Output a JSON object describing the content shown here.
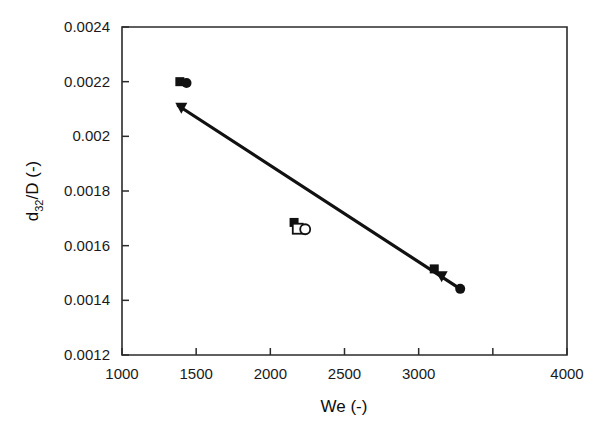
{
  "chart_data": {
    "type": "scatter",
    "title": "",
    "xlabel": "We (-)",
    "ylabel": "d32/D (-)",
    "ylabel_base": "d",
    "ylabel_sub": "32",
    "ylabel_rest": "/D (-)",
    "xlim": [
      1000,
      4000
    ],
    "ylim": [
      0.0012,
      0.0024
    ],
    "grid": false,
    "legend": "none",
    "xticks": [
      1000,
      1500,
      2000,
      2500,
      3000,
      3500,
      4000
    ],
    "xtick_labels": [
      "1000",
      "1500",
      "2000",
      "2500",
      "3000",
      "",
      "4000"
    ],
    "yticks": [
      0.0012,
      0.0014,
      0.0016,
      0.0018,
      0.002,
      0.0022,
      0.0024
    ],
    "ytick_labels": [
      "0.0012",
      "0.0014",
      "0.0016",
      "0.0018",
      "0.002",
      "0.0022",
      "0.0024"
    ],
    "series": [
      {
        "name": "filled-square",
        "marker": "filled-square",
        "points": [
          {
            "x": 1390,
            "y": 0.0022
          },
          {
            "x": 2160,
            "y": 0.001685
          },
          {
            "x": 3105,
            "y": 0.001515
          }
        ]
      },
      {
        "name": "filled-circle",
        "marker": "filled-circle",
        "points": [
          {
            "x": 1435,
            "y": 0.002195
          },
          {
            "x": 3280,
            "y": 0.001442
          }
        ]
      },
      {
        "name": "filled-triangle-down",
        "marker": "filled-triangle-down",
        "points": [
          {
            "x": 1400,
            "y": 0.002105
          },
          {
            "x": 3155,
            "y": 0.001488
          }
        ]
      },
      {
        "name": "open-square",
        "marker": "open-square",
        "points": [
          {
            "x": 2185,
            "y": 0.001662
          }
        ]
      },
      {
        "name": "open-circle",
        "marker": "open-circle",
        "points": [
          {
            "x": 2235,
            "y": 0.00166
          }
        ]
      }
    ],
    "trend_line": {
      "name": "fit-line",
      "x": [
        1380,
        3280
      ],
      "y": [
        0.002112,
        0.001442
      ]
    }
  }
}
